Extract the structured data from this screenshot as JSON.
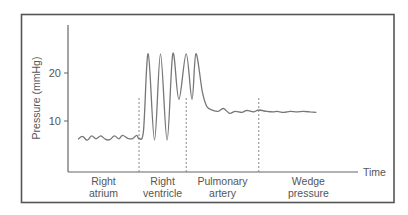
{
  "chart_data": {
    "type": "line",
    "title": "",
    "xlabel": "Time",
    "ylabel": "Pressure (mmHg)",
    "yticks": [
      10,
      20
    ],
    "ylim": [
      0,
      30
    ],
    "grid": false,
    "legend": "none",
    "colors": {
      "frame": "#555555",
      "trace": "#777777",
      "axis": "#666666",
      "divider": "#888888"
    },
    "segments": [
      {
        "label_line1": "Right",
        "label_line2": "atrium"
      },
      {
        "label_line1": "Right",
        "label_line2": "ventricle"
      },
      {
        "label_line1": "Pulmonary",
        "label_line2": "artery"
      },
      {
        "label_line1": "Wedge",
        "label_line2": "pressure"
      }
    ],
    "dividers_time": [
      0.233,
      0.413,
      0.69
    ],
    "series": [
      {
        "name": "Pressure trace",
        "x": [
          0.0,
          0.017,
          0.035,
          0.052,
          0.069,
          0.087,
          0.104,
          0.121,
          0.139,
          0.156,
          0.17,
          0.19,
          0.207,
          0.224,
          0.233,
          0.25,
          0.268,
          0.292,
          0.315,
          0.34,
          0.362,
          0.385,
          0.413,
          0.435,
          0.45,
          0.475,
          0.492,
          0.515,
          0.535,
          0.555,
          0.578,
          0.6,
          0.625,
          0.645,
          0.67,
          0.69,
          0.72,
          0.745,
          0.76,
          0.785,
          0.81,
          0.835,
          0.86,
          0.885,
          0.91
        ],
        "y": [
          6.2,
          6.8,
          6.0,
          6.9,
          6.3,
          6.9,
          6.2,
          6.1,
          6.9,
          6.3,
          7.0,
          6.4,
          6.3,
          7.0,
          6.4,
          8.0,
          24.0,
          6.0,
          24.0,
          6.0,
          24.0,
          14.5,
          24.0,
          14.5,
          24.0,
          16.0,
          13.0,
          12.2,
          12.0,
          12.6,
          11.6,
          12.0,
          11.8,
          12.2,
          11.9,
          12.3,
          12.0,
          11.9,
          12.0,
          11.8,
          12.0,
          11.9,
          12.0,
          11.9,
          11.8
        ]
      }
    ]
  }
}
